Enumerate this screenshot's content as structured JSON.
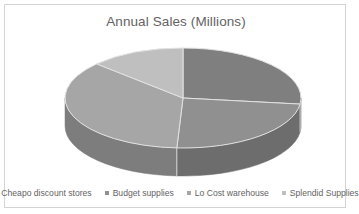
{
  "chart_data": {
    "type": "pie",
    "title": "Annual Sales (Millions)",
    "xlabel": "",
    "ylabel": "",
    "three_d": true,
    "legend_position": "bottom",
    "grid": false,
    "categories": [
      "Cheapo discount stores",
      "Budget supplies",
      "Lo Cost warehouse",
      "Splendid Supplies"
    ],
    "values": [
      27,
      24,
      36,
      13
    ],
    "units": "percent",
    "colors": [
      "#7f7f7f",
      "#909090",
      "#a6a6a6",
      "#bfbfbf"
    ],
    "slices": [
      {
        "label": "Cheapo discount stores",
        "value": 27,
        "start_angle": 0,
        "end_angle": 97,
        "color": "#7f7f7f",
        "side_color": "#5f5f5f"
      },
      {
        "label": "Budget supplies",
        "value": 24,
        "start_angle": 97,
        "end_angle": 183,
        "color": "#909090",
        "side_color": "#6d6d6d"
      },
      {
        "label": "Lo Cost warehouse",
        "value": 36,
        "start_angle": 183,
        "end_angle": 313,
        "color": "#a6a6a6",
        "side_color": "#7d7d7d"
      },
      {
        "label": "Splendid Supplies",
        "value": 13,
        "start_angle": 313,
        "end_angle": 360,
        "color": "#bfbfbf",
        "side_color": "#8f8f8f"
      }
    ]
  },
  "frame": {
    "border_color": "#d4d4d4",
    "background": "#ffffff"
  },
  "title": {
    "text": "Annual Sales (Millions)",
    "color": "#636363"
  },
  "legend": {
    "items": [
      {
        "label": "Cheapo discount stores",
        "color": "#7f7f7f"
      },
      {
        "label": "Budget supplies",
        "color": "#909090"
      },
      {
        "label": "Lo Cost warehouse",
        "color": "#a6a6a6"
      },
      {
        "label": "Splendid Supplies",
        "color": "#bfbfbf"
      }
    ]
  }
}
